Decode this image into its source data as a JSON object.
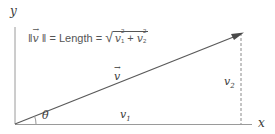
{
  "diagram": {
    "formula": {
      "norm_open": "‖",
      "vec_symbol": "v",
      "norm_close": "‖",
      "equals1": "=",
      "word": "Length",
      "equals2": "=",
      "radical": "√",
      "term1_base": "v",
      "term1_sub": "1",
      "term1_sup": "2",
      "plus": "+",
      "term2_base": "v",
      "term2_sub": "2",
      "term2_sup": "2"
    },
    "labels": {
      "y_axis": "y",
      "x_axis": "x",
      "vector": "v",
      "v1": "v",
      "v1_sub": "1",
      "v2": "v",
      "v2_sub": "2",
      "angle": "θ"
    },
    "geometry": {
      "origin": [
        15,
        124
      ],
      "y_axis_top": [
        15,
        27
      ],
      "x_axis_end": [
        252,
        124
      ],
      "vector_tip": [
        243,
        33
      ],
      "dashed_x": 241
    },
    "colors": {
      "axis": "#8a8a8a",
      "vector": "#555555",
      "dashed": "#888888",
      "text": "#3a3a3a"
    }
  }
}
